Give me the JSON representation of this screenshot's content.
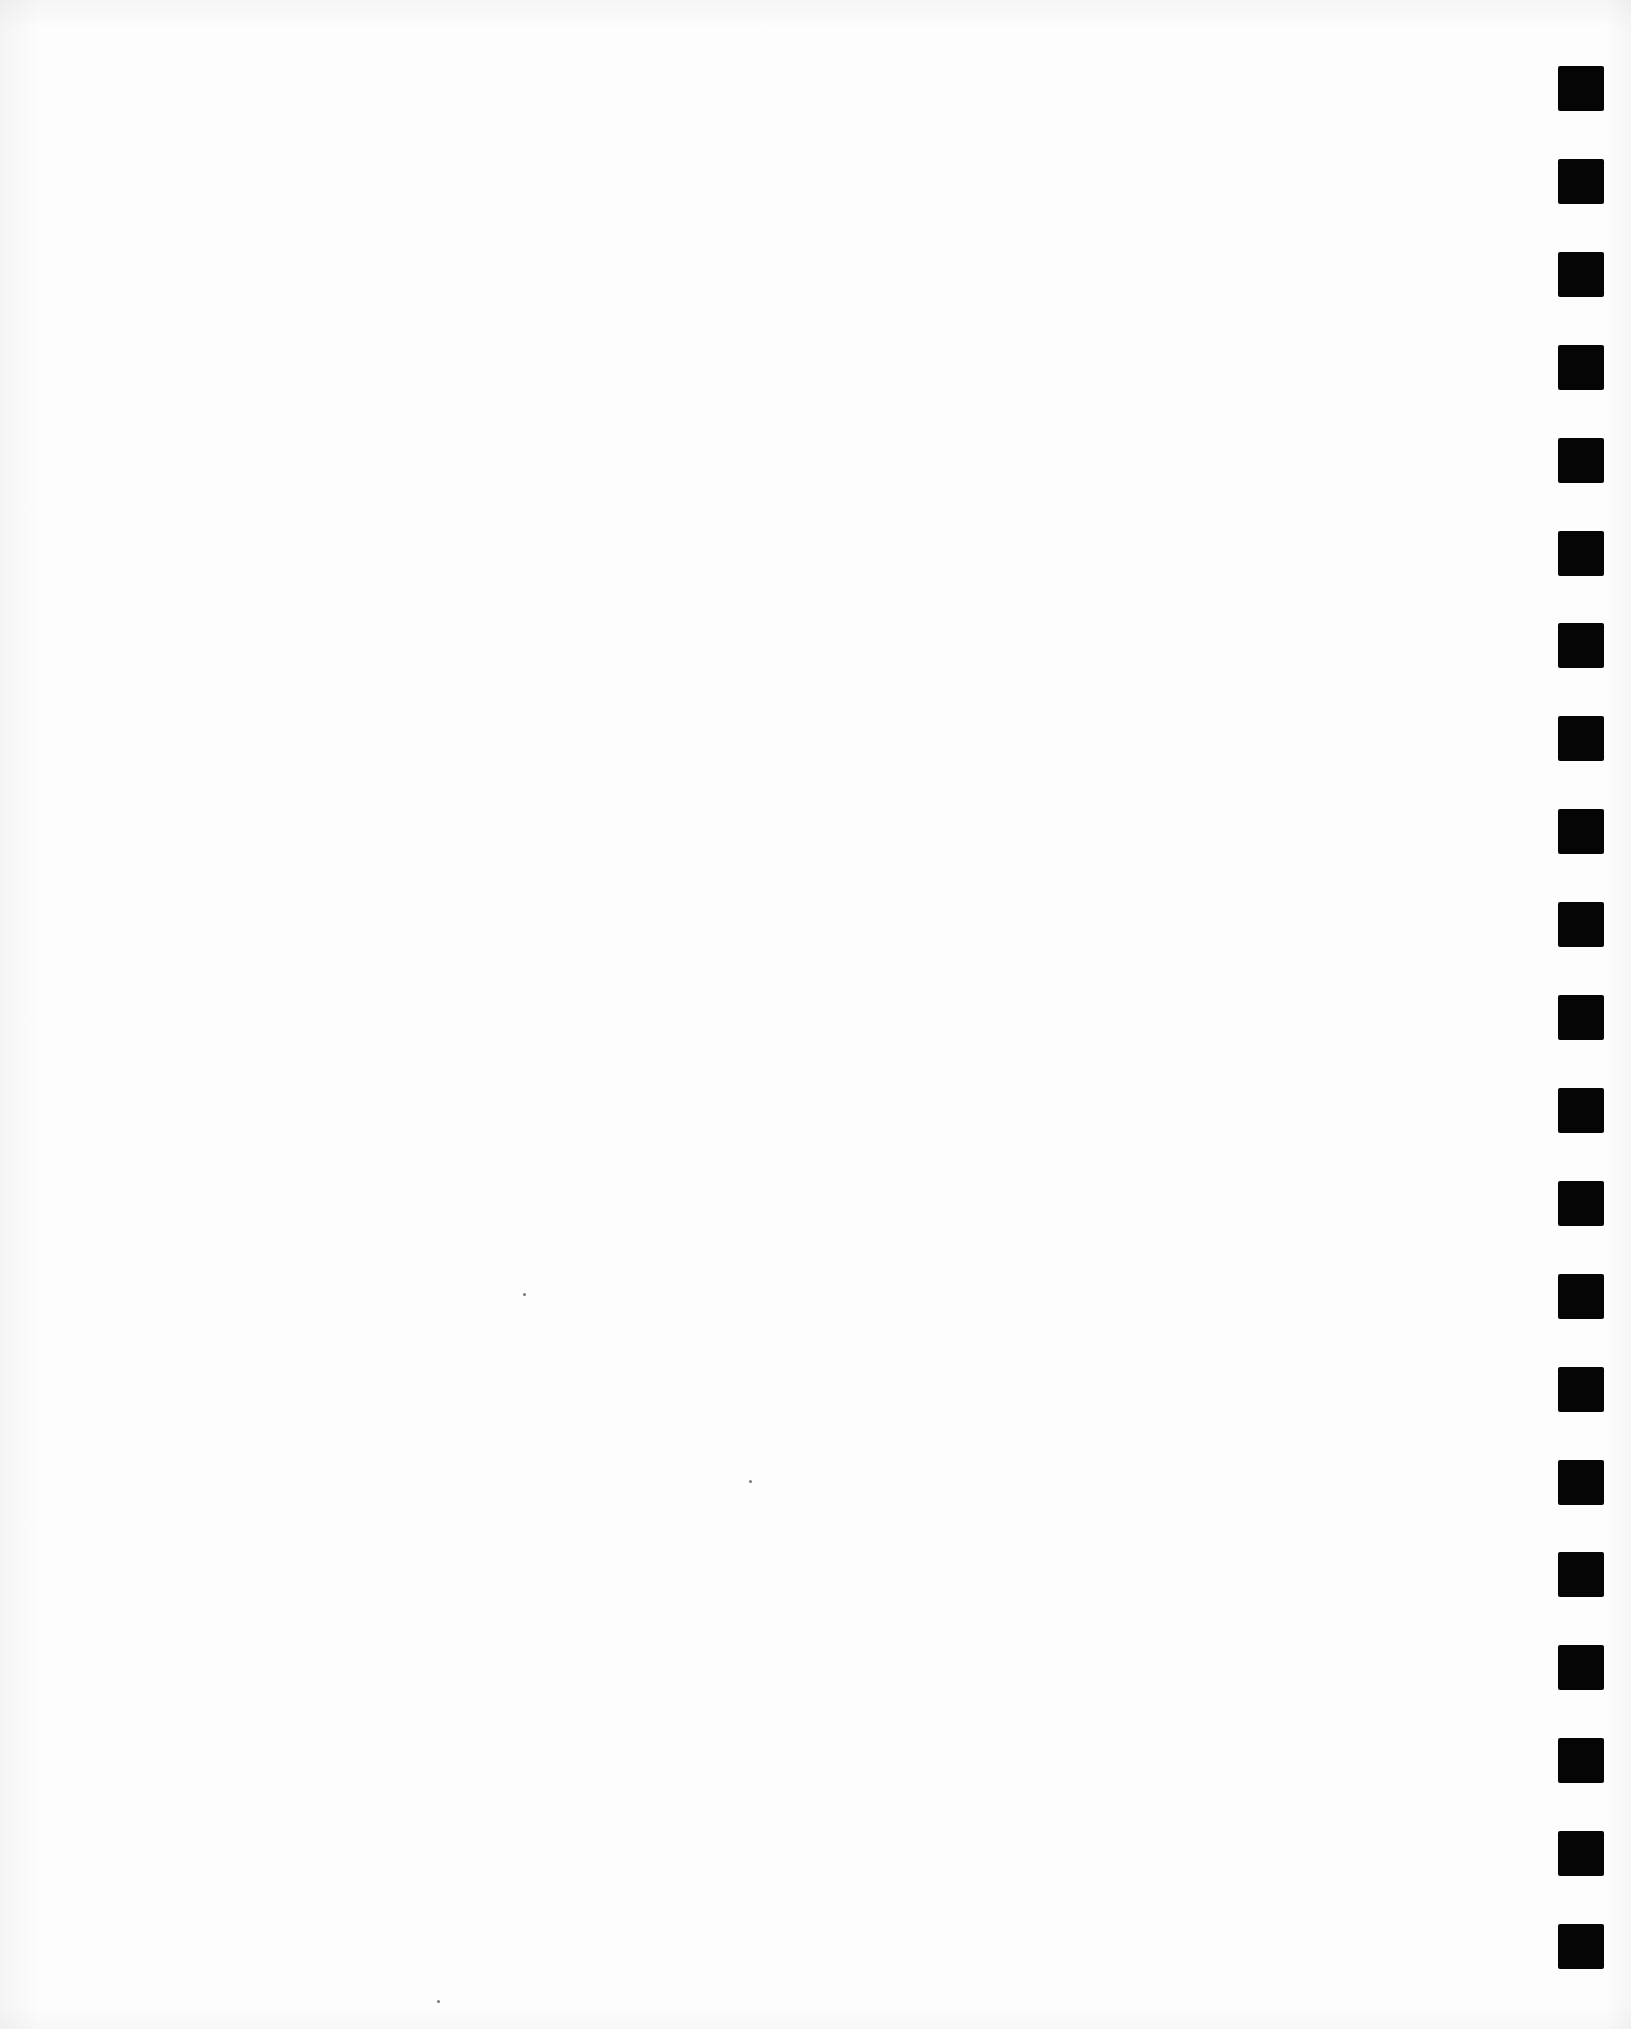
{
  "page": {
    "type": "blank scanned page",
    "background_color": "#fdfdfd",
    "text_content": ""
  },
  "binding_marks": {
    "count": 21,
    "color": "#050505",
    "side": "right",
    "first_top_px": 66,
    "spacing_px": 92.9,
    "size_px": [
      46,
      45
    ]
  },
  "specks": [
    {
      "x": 523,
      "y": 1293
    },
    {
      "x": 749,
      "y": 1480
    },
    {
      "x": 437,
      "y": 2000
    }
  ]
}
